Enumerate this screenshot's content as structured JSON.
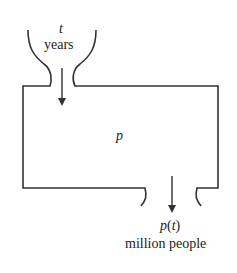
{
  "diagram": {
    "input": {
      "variable": "t",
      "unit": "years"
    },
    "box": {
      "label": "p"
    },
    "output": {
      "variable_main": "p",
      "variable_open": "(",
      "variable_arg": "t",
      "variable_close": ")",
      "unit": "million people"
    },
    "colors": {
      "stroke": "#333333",
      "background": "#ffffff"
    }
  }
}
